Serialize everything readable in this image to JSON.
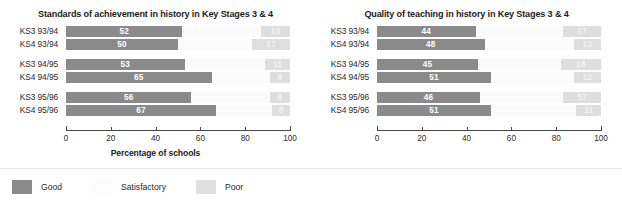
{
  "axis": {
    "caption": "Percentage of schools",
    "ticks": [
      0,
      20,
      40,
      60,
      80,
      100
    ],
    "min": 0,
    "max": 100
  },
  "legend": {
    "items": [
      {
        "label": "Good",
        "color": "#8a8a8a",
        "swatch": "good"
      },
      {
        "label": "Satisfactory",
        "color": "#fcfcfc",
        "swatch": "satis"
      },
      {
        "label": "Poor",
        "color": "#e0e0e0",
        "swatch": "poor"
      }
    ]
  },
  "charts": [
    {
      "title": "Standards of achievement in history in Key Stages 3 & 4",
      "groups": [
        {
          "rows": [
            {
              "label": "KS3 93/94",
              "good": 52,
              "satisfactory": 35,
              "poor": 13
            },
            {
              "label": "KS4 93/94",
              "good": 50,
              "satisfactory": 33,
              "poor": 17
            }
          ]
        },
        {
          "rows": [
            {
              "label": "KS3 94/95",
              "good": 53,
              "satisfactory": 36,
              "poor": 11
            },
            {
              "label": "KS4 94/95",
              "good": 65,
              "satisfactory": 26,
              "poor": 9
            }
          ]
        },
        {
          "rows": [
            {
              "label": "KS3 95/96",
              "good": 56,
              "satisfactory": 35,
              "poor": 9
            },
            {
              "label": "KS4 95/96",
              "good": 67,
              "satisfactory": 25,
              "poor": 8
            }
          ]
        }
      ]
    },
    {
      "title": "Quality of teaching in history in Key Stages 3 & 4",
      "groups": [
        {
          "rows": [
            {
              "label": "KS3 93/94",
              "good": 44,
              "satisfactory": 39,
              "poor": 17
            },
            {
              "label": "KS4 93/94",
              "good": 48,
              "satisfactory": 40,
              "poor": 12
            }
          ]
        },
        {
          "rows": [
            {
              "label": "KS3 94/95",
              "good": 45,
              "satisfactory": 37,
              "poor": 18
            },
            {
              "label": "KS4 94/95",
              "good": 51,
              "satisfactory": 37,
              "poor": 12
            }
          ]
        },
        {
          "rows": [
            {
              "label": "KS3 95/96",
              "good": 46,
              "satisfactory": 37,
              "poor": 17
            },
            {
              "label": "KS4 95/96",
              "good": 51,
              "satisfactory": 38,
              "poor": 11
            }
          ]
        }
      ]
    }
  ],
  "chart_data": {
    "type": "bar",
    "orientation": "horizontal",
    "stacked": true,
    "xlabel": "Percentage of schools",
    "ylabel": "",
    "xlim": [
      0,
      100
    ],
    "xticks": [
      0,
      20,
      40,
      60,
      80,
      100
    ],
    "grid": false,
    "legend": [
      "Good",
      "Satisfactory",
      "Poor"
    ],
    "legend_position": "bottom-left",
    "panels": [
      {
        "title": "Standards of achievement in history in Key Stages 3 & 4",
        "categories": [
          "KS3 93/94",
          "KS4 93/94",
          "KS3 94/95",
          "KS4 94/95",
          "KS3 95/96",
          "KS4 95/96"
        ],
        "series": [
          {
            "name": "Good",
            "values": [
              52,
              50,
              53,
              65,
              56,
              67
            ]
          },
          {
            "name": "Satisfactory",
            "values": [
              35,
              33,
              36,
              26,
              35,
              25
            ]
          },
          {
            "name": "Poor",
            "values": [
              13,
              17,
              11,
              9,
              9,
              8
            ]
          }
        ]
      },
      {
        "title": "Quality of teaching in history in Key Stages 3 & 4",
        "categories": [
          "KS3 93/94",
          "KS4 93/94",
          "KS3 94/95",
          "KS4 94/95",
          "KS3 95/96",
          "KS4 95/96"
        ],
        "series": [
          {
            "name": "Good",
            "values": [
              44,
              48,
              45,
              51,
              46,
              51
            ]
          },
          {
            "name": "Satisfactory",
            "values": [
              39,
              40,
              37,
              37,
              37,
              38
            ]
          },
          {
            "name": "Poor",
            "values": [
              17,
              12,
              18,
              12,
              17,
              11
            ]
          }
        ]
      }
    ]
  }
}
